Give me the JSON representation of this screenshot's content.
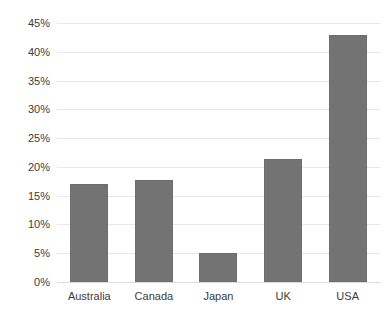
{
  "chart_data": {
    "type": "bar",
    "title": "",
    "subtitle": "",
    "xlabel": "",
    "ylabel": "",
    "categories": [
      "Australia",
      "Canada",
      "Japan",
      "UK",
      "USA"
    ],
    "values": [
      17.0,
      17.8,
      5.0,
      21.4,
      43.0
    ],
    "value_labels": [
      "17.0%",
      "17.8%",
      "5.0%",
      "21.4%",
      "43.0%"
    ],
    "ylim": [
      0,
      45
    ],
    "y_ticks": [
      0,
      5,
      10,
      15,
      20,
      25,
      30,
      35,
      40,
      45
    ],
    "y_tick_labels": [
      "0%",
      "5%",
      "10%",
      "15%",
      "20%",
      "25%",
      "30%",
      "35%",
      "40%",
      "45%"
    ],
    "grid": true,
    "grid_axis": "y",
    "legend": false,
    "legend_position": "none",
    "series": [
      {
        "name": "",
        "values": [
          17.0,
          17.8,
          5.0,
          21.4,
          43.0
        ]
      }
    ],
    "annotations": []
  },
  "style": {
    "bar_color": "#737373",
    "bar_border_color": "#6e6e6e",
    "gridline_color": "#e8e8e8",
    "baseline_color": "#dcdcdc",
    "axis_text_color": "#3c3c3c",
    "background_color": "#ffffff"
  }
}
